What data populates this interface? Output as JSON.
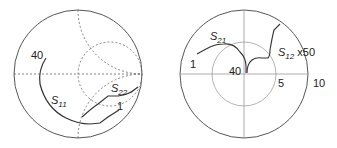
{
  "smith_chart": {
    "title": "Smith chart",
    "labels": {
      "s11": {
        "main": "S",
        "sub": "11"
      },
      "s22": {
        "main": "S",
        "sub": "22"
      },
      "freq_start": "40",
      "freq_end": "1"
    },
    "colors": {
      "trace": "#333333",
      "grid": "#666666",
      "outline": "#555555"
    }
  },
  "polar_chart": {
    "title": "Polar plot",
    "labels": {
      "s21": {
        "main": "S",
        "sub": "21"
      },
      "s12": {
        "main": "S",
        "sub": "12",
        "suffix": " x50"
      },
      "freq_low": "1",
      "freq_high": "40",
      "ring_inner": "5",
      "ring_outer": "10"
    },
    "colors": {
      "trace": "#333333",
      "grid": "#999999",
      "inner_ring": "#aaaaaa",
      "outline": "#555555"
    }
  }
}
